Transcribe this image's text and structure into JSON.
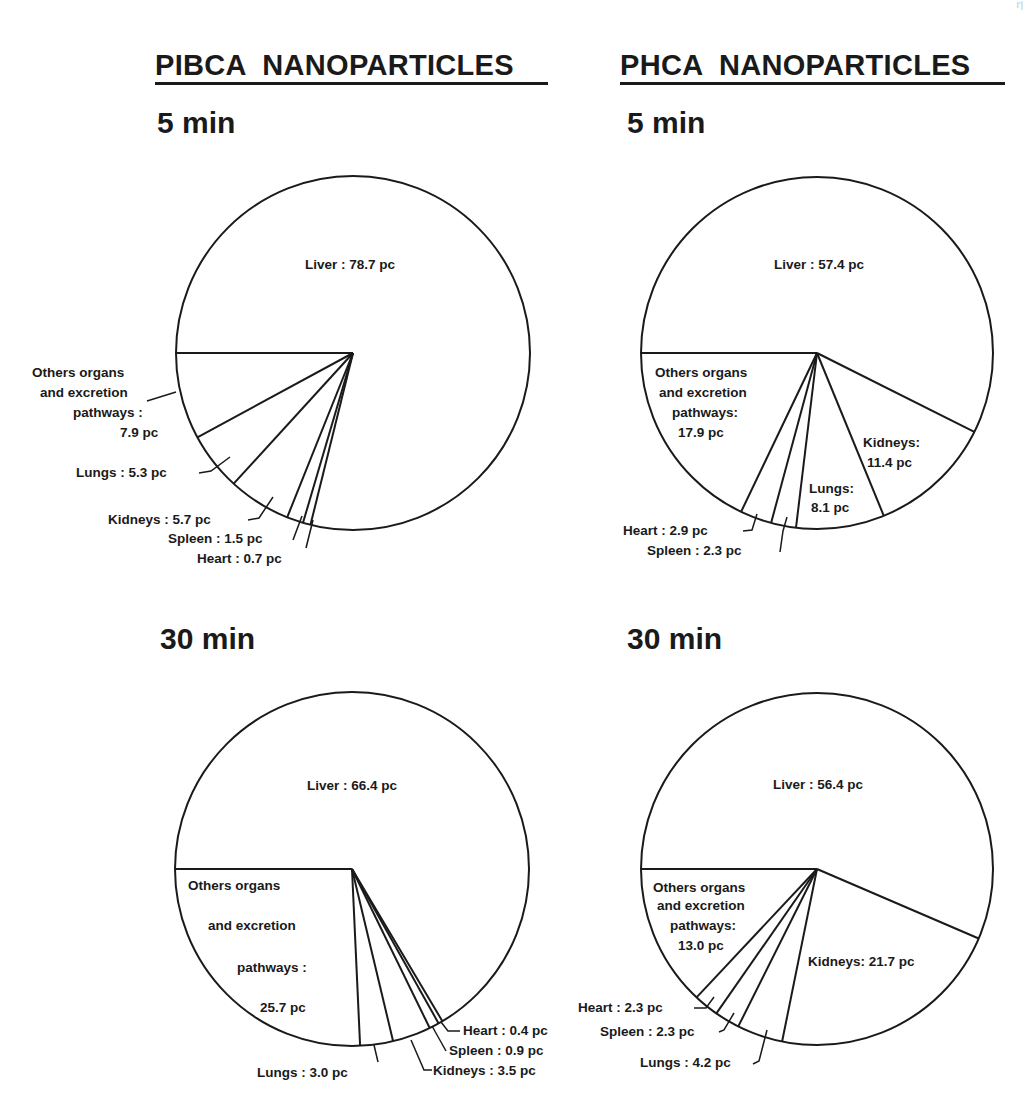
{
  "headings": {
    "left": "PIBCA  NANOPARTICLES",
    "right": "PHCA  NANOPARTICLES"
  },
  "time_labels": {
    "top_left": "5 min",
    "top_right": "5 min",
    "bottom_left": "30 min",
    "bottom_right": "30 min"
  },
  "page_mark": "I'|",
  "colors": {
    "ink": "#1a1a1a",
    "background": "#ffffff"
  },
  "chart_data": [
    {
      "type": "pie",
      "title": "PIBCA NANOPARTICLES — 5 min",
      "unit": "pc",
      "categories": [
        "Others organs and excretion pathways",
        "Lungs",
        "Kidneys",
        "Spleen",
        "Heart",
        "Liver"
      ],
      "values": [
        7.9,
        5.3,
        5.7,
        1.5,
        0.7,
        78.7
      ],
      "center": [
        353,
        353
      ],
      "radius": 177,
      "labels": [
        {
          "lines": [
            "Others organs",
            "and excretion",
            "pathways :",
            "7.9 pc"
          ],
          "x": [
            32,
            40,
            73,
            120
          ],
          "y": [
            377,
            397,
            417,
            437
          ],
          "leader": [
            [
              147,
              401
            ],
            [
              176,
              392
            ]
          ]
        },
        {
          "lines": [
            "Lungs : 5.3 pc"
          ],
          "x": [
            76
          ],
          "y": [
            477
          ],
          "leader": [
            [
              199,
              473
            ],
            [
              211,
              471
            ],
            [
              230,
              457
            ]
          ]
        },
        {
          "lines": [
            "Kidneys : 5.7 pc"
          ],
          "x": [
            108
          ],
          "y": [
            524
          ],
          "leader": [
            [
              248,
              520
            ],
            [
              259,
              518
            ],
            [
              273,
              497
            ]
          ]
        },
        {
          "lines": [
            "Spleen : 1.5 pc"
          ],
          "x": [
            168
          ],
          "y": [
            543
          ],
          "leader": [
            [
              293,
              540
            ],
            [
              302,
              516
            ]
          ]
        },
        {
          "lines": [
            "Heart : 0.7 pc"
          ],
          "x": [
            197
          ],
          "y": [
            563
          ],
          "leader": [
            [
              306,
              548
            ],
            [
              313,
              520
            ]
          ]
        },
        {
          "lines": [
            "Liver : 78.7 pc"
          ],
          "x": [
            305
          ],
          "y": [
            269
          ],
          "leader": []
        }
      ]
    },
    {
      "type": "pie",
      "title": "PHCA NANOPARTICLES — 5 min",
      "unit": "pc",
      "categories": [
        "Others organs and excretion pathways",
        "Heart",
        "Spleen",
        "Lungs",
        "Kidneys",
        "Liver"
      ],
      "values": [
        17.9,
        2.9,
        2.3,
        8.1,
        11.4,
        57.4
      ],
      "center": [
        817,
        353
      ],
      "radius": 176,
      "labels": [
        {
          "lines": [
            "Others organs",
            "and excretion",
            "pathways:",
            "17.9 pc"
          ],
          "x": [
            655,
            659,
            672,
            678
          ],
          "y": [
            377,
            397,
            417,
            437
          ],
          "leader": []
        },
        {
          "lines": [
            "Heart : 2.9 pc"
          ],
          "x": [
            623
          ],
          "y": [
            535
          ],
          "leader": [
            [
              743,
              531
            ],
            [
              752,
              530
            ],
            [
              757,
              514
            ]
          ]
        },
        {
          "lines": [
            "Spleen : 2.3 pc"
          ],
          "x": [
            647
          ],
          "y": [
            555
          ],
          "leader": [
            [
              780,
              552
            ],
            [
              783,
              531
            ],
            [
              787,
              517
            ]
          ]
        },
        {
          "lines": [
            "Lungs:",
            "8.1 pc"
          ],
          "x": [
            809,
            811
          ],
          "y": [
            493,
            512
          ],
          "leader": []
        },
        {
          "lines": [
            "Kidneys:",
            "11.4 pc"
          ],
          "x": [
            863,
            867
          ],
          "y": [
            447,
            467
          ],
          "leader": []
        },
        {
          "lines": [
            "Liver : 57.4 pc"
          ],
          "x": [
            774
          ],
          "y": [
            269
          ],
          "leader": []
        }
      ]
    },
    {
      "type": "pie",
      "title": "PIBCA NANOPARTICLES — 30 min",
      "unit": "pc",
      "categories": [
        "Others organs and excretion pathways",
        "Lungs",
        "Kidneys",
        "Spleen",
        "Heart",
        "Liver"
      ],
      "values": [
        25.7,
        3.0,
        3.5,
        0.9,
        0.4,
        66.4
      ],
      "center": [
        352,
        869
      ],
      "radius": 177,
      "labels": [
        {
          "lines": [
            "Others organs",
            "and excretion",
            "pathways :",
            "25.7 pc"
          ],
          "x": [
            188,
            208,
            237,
            260
          ],
          "y": [
            890,
            930,
            972,
            1012
          ],
          "leader": []
        },
        {
          "lines": [
            "Lungs : 3.0 pc"
          ],
          "x": [
            257
          ],
          "y": [
            1077
          ],
          "leader": [
            [
              378,
              1062
            ],
            [
              374,
              1045
            ]
          ]
        },
        {
          "lines": [
            "Kidneys : 3.5 pc"
          ],
          "x": [
            433
          ],
          "y": [
            1075
          ],
          "leader": [
            [
              432,
              1070
            ],
            [
              424,
              1070
            ],
            [
              411,
              1040
            ]
          ]
        },
        {
          "lines": [
            "Spleen : 0.9 pc"
          ],
          "x": [
            449
          ],
          "y": [
            1055
          ],
          "leader": [
            [
              446,
              1051
            ],
            [
              432,
              1026
            ]
          ]
        },
        {
          "lines": [
            "Heart : 0.4 pc"
          ],
          "x": [
            463
          ],
          "y": [
            1035
          ],
          "leader": [
            [
              460,
              1031
            ],
            [
              448,
              1031
            ],
            [
              441,
              1022
            ]
          ]
        },
        {
          "lines": [
            "Liver : 66.4 pc"
          ],
          "x": [
            307
          ],
          "y": [
            790
          ],
          "leader": []
        }
      ]
    },
    {
      "type": "pie",
      "title": "PHCA NANOPARTICLES — 30 min",
      "unit": "pc",
      "categories": [
        "Others organs and excretion pathways",
        "Heart",
        "Spleen",
        "Lungs",
        "Kidneys",
        "Liver"
      ],
      "values": [
        13.0,
        2.3,
        2.3,
        4.2,
        21.7,
        56.4
      ],
      "center": [
        817,
        869
      ],
      "radius": 176,
      "labels": [
        {
          "lines": [
            "Others organs",
            "and excretion",
            "pathways:",
            "13.0 pc"
          ],
          "x": [
            653,
            657,
            670,
            678
          ],
          "y": [
            892,
            910,
            930,
            950
          ],
          "leader": []
        },
        {
          "lines": [
            "Heart : 2.3 pc"
          ],
          "x": [
            578
          ],
          "y": [
            1012
          ],
          "leader": [
            [
              694,
              1008
            ],
            [
              706,
              1008
            ],
            [
              714,
              997
            ]
          ]
        },
        {
          "lines": [
            "Spleen : 2.3 pc"
          ],
          "x": [
            600
          ],
          "y": [
            1036
          ],
          "leader": [
            [
              719,
              1032
            ],
            [
              724,
              1030
            ],
            [
              734,
              1013
            ]
          ]
        },
        {
          "lines": [
            "Lungs : 4.2 pc"
          ],
          "x": [
            640
          ],
          "y": [
            1067
          ],
          "leader": [
            [
              753,
              1064
            ],
            [
              759,
              1061
            ],
            [
              767,
              1030
            ]
          ]
        },
        {
          "lines": [
            "Kidneys: 21.7 pc"
          ],
          "x": [
            808
          ],
          "y": [
            966
          ],
          "leader": []
        },
        {
          "lines": [
            "Liver : 56.4 pc"
          ],
          "x": [
            773
          ],
          "y": [
            789
          ],
          "leader": []
        }
      ]
    }
  ]
}
